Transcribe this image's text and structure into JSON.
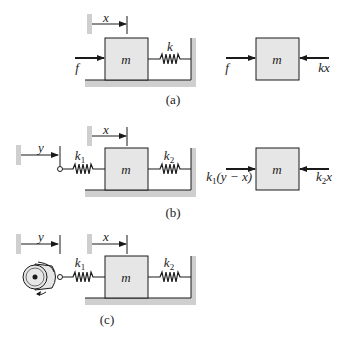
{
  "colors": {
    "ink": "#1a1a1a",
    "mass_fill": "#e6e6e6",
    "ground_fill": "#cfcfcf",
    "background": "#ffffff"
  },
  "panels": [
    {
      "id": "a",
      "caption": "(a)",
      "system": {
        "displacement_label": "x",
        "mass_label": "m",
        "spring_label": "k",
        "force_label": "f"
      },
      "free_body": {
        "mass_label": "m",
        "left_force": "f",
        "right_force": "kx"
      }
    },
    {
      "id": "b",
      "caption": "(b)",
      "system": {
        "input_displacement_label": "y",
        "displacement_label": "x",
        "mass_label": "m",
        "left_spring_label": "k",
        "left_spring_sub": "1",
        "right_spring_label": "k",
        "right_spring_sub": "2"
      },
      "free_body": {
        "mass_label": "m",
        "left_force_k": "k",
        "left_force_sub": "1",
        "left_force_rest": "(y − x)",
        "right_force_k": "k",
        "right_force_sub": "2",
        "right_force_rest": "x"
      }
    },
    {
      "id": "c",
      "caption": "(c)",
      "system": {
        "input_displacement_label": "y",
        "displacement_label": "x",
        "mass_label": "m",
        "left_spring_label": "k",
        "left_spring_sub": "1",
        "right_spring_label": "k",
        "right_spring_sub": "2",
        "driver": "rotating-cam"
      }
    }
  ]
}
